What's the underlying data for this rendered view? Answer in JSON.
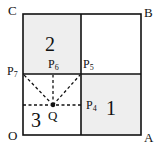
{
  "diagram": {
    "colors": {
      "line": "#111111",
      "shade": "#eeeeee",
      "background": "#ffffff"
    },
    "square": {
      "x": 23,
      "y": 14,
      "size_w": 118,
      "size_h": 121,
      "mid_x": 81,
      "mid_y": 74
    },
    "vertices": {
      "C": "C",
      "B": "B",
      "O": "O",
      "A": "A"
    },
    "points": {
      "P7": {
        "base": "P",
        "sub": "7"
      },
      "P6": {
        "base": "P",
        "sub": "6"
      },
      "P5": {
        "base": "P",
        "sub": "5"
      },
      "P4": {
        "base": "P",
        "sub": "4"
      },
      "Q": {
        "base": "Q",
        "x": 53,
        "y": 105
      }
    },
    "regions": {
      "r1": "1",
      "r2": "2",
      "r3": "3"
    },
    "shaded_regions": [
      "2",
      "1"
    ]
  }
}
